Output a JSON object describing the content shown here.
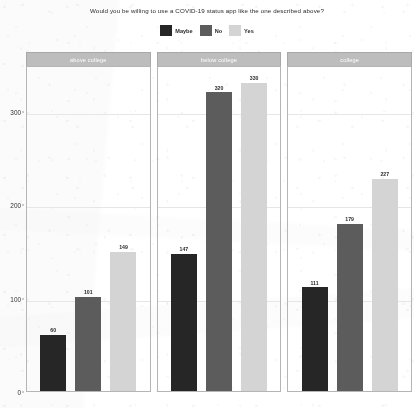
{
  "chart_data": {
    "type": "bar",
    "title": "Would you be willing to use a COVID-19 status app like the one described above?",
    "xlabel": "",
    "ylabel": "",
    "ylim": [
      0,
      350
    ],
    "yticks": [
      0,
      100,
      200,
      300
    ],
    "ytick_labels": [
      "0",
      "100",
      "200",
      "300"
    ],
    "grid": true,
    "legend_position": "top",
    "facet_variable": "education",
    "facets": [
      "above college",
      "below college",
      "college"
    ],
    "categories": [
      "Maybe",
      "No",
      "Yes"
    ],
    "series": [
      {
        "name": "Maybe",
        "color": "#262626",
        "values": [
          60,
          147,
          111
        ]
      },
      {
        "name": "No",
        "color": "#5c5c5c",
        "values": [
          101,
          320,
          179
        ]
      },
      {
        "name": "Yes",
        "color": "#d4d4d4",
        "values": [
          149,
          330,
          227
        ]
      }
    ],
    "panels": [
      {
        "header": "above college",
        "bars": [
          {
            "label": "Maybe",
            "value": 60,
            "value_text": "60",
            "color": "#262626"
          },
          {
            "label": "No",
            "value": 101,
            "value_text": "101",
            "color": "#5c5c5c"
          },
          {
            "label": "Yes",
            "value": 149,
            "value_text": "149",
            "color": "#d4d4d4"
          }
        ]
      },
      {
        "header": "below college",
        "bars": [
          {
            "label": "Maybe",
            "value": 147,
            "value_text": "147",
            "color": "#262626"
          },
          {
            "label": "No",
            "value": 320,
            "value_text": "320",
            "color": "#5c5c5c"
          },
          {
            "label": "Yes",
            "value": 330,
            "value_text": "330",
            "color": "#d4d4d4"
          }
        ]
      },
      {
        "header": "college",
        "bars": [
          {
            "label": "Maybe",
            "value": 111,
            "value_text": "111",
            "color": "#262626"
          },
          {
            "label": "No",
            "value": 179,
            "value_text": "179",
            "color": "#5c5c5c"
          },
          {
            "label": "Yes",
            "value": 227,
            "value_text": "227",
            "color": "#d4d4d4"
          }
        ]
      }
    ]
  },
  "legend": {
    "entries": [
      {
        "label": "Maybe",
        "color": "#262626"
      },
      {
        "label": "No",
        "color": "#5c5c5c"
      },
      {
        "label": "Yes",
        "color": "#d4d4d4"
      }
    ]
  },
  "colors": {
    "maybe": "#262626",
    "no": "#5c5c5c",
    "yes": "#d4d4d4",
    "panel_header_bg": "#bdbdbd",
    "panel_border": "#b5b5b5",
    "gridline": "#e6e6e6",
    "text": "#2b2b2b"
  }
}
